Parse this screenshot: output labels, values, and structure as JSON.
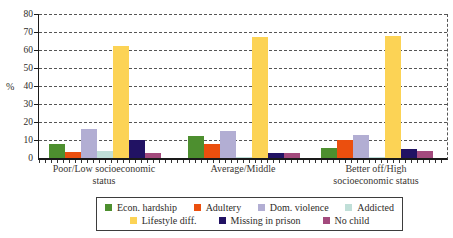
{
  "chart_data": {
    "type": "bar",
    "title": "",
    "xlabel": "",
    "ylabel": "%",
    "ylim": [
      0,
      80
    ],
    "yticks": [
      0,
      10,
      20,
      30,
      40,
      50,
      60,
      70,
      80
    ],
    "grid": "horizontal dashed gridlines every 10; dashed right plot border",
    "legend_position": "boxed legend below chart, two rows",
    "categories": [
      "Poor/Low socioeconomic status",
      "Average/Middle",
      "Better off/High socioeconomic status"
    ],
    "series": [
      {
        "name": "Econ. hardship",
        "color": "#4d8f2f",
        "values": [
          8,
          12,
          5.5
        ]
      },
      {
        "name": "Adultery",
        "color": "#eb4f0e",
        "values": [
          3.5,
          8,
          10
        ]
      },
      {
        "name": "Dom. violence",
        "color": "#b2aed3",
        "values": [
          16,
          15,
          13
        ]
      },
      {
        "name": "Addicted",
        "color": "#c0dfd8",
        "values": [
          4,
          0.5,
          0.5
        ]
      },
      {
        "name": "Lifestyle diff.",
        "color": "#fcd355",
        "values": [
          62,
          67,
          68
        ]
      },
      {
        "name": "Missing in prison",
        "color": "#211263",
        "values": [
          10,
          3,
          5
        ]
      },
      {
        "name": "No child",
        "color": "#a34a7d",
        "values": [
          3,
          2.5,
          4
        ]
      }
    ],
    "legend_rows": [
      [
        0,
        1,
        2,
        3
      ],
      [
        4,
        5,
        6
      ]
    ]
  }
}
